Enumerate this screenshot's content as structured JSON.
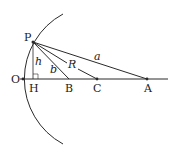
{
  "diagram": {
    "type": "geometry",
    "points": {
      "P": {
        "label": "P",
        "x": 33,
        "y": 42
      },
      "O": {
        "label": "O",
        "x": 23,
        "y": 79
      },
      "H": {
        "label": "H",
        "x": 33,
        "y": 79
      },
      "B": {
        "label": "B",
        "x": 69,
        "y": 79
      },
      "C": {
        "label": "C",
        "x": 97,
        "y": 79
      },
      "A": {
        "label": "A",
        "x": 147,
        "y": 79
      }
    },
    "segments": {
      "PA": {
        "label": "a"
      },
      "PC": {
        "label": "R"
      },
      "PB": {
        "label": "b"
      },
      "PH": {
        "label": "h"
      }
    },
    "colors": {
      "stroke": "#2a2a2a",
      "text": "#222222"
    }
  }
}
